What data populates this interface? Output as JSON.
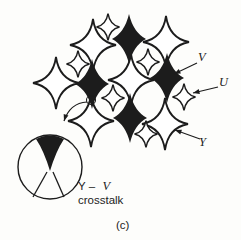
{
  "figure": {
    "caption": "(c)",
    "ink_color": "#1c1c1c",
    "paper_color": "#fdfdfb",
    "labels": {
      "v": "V",
      "u": "U",
      "y": "Y"
    },
    "crosstalk": {
      "prefix": "Y –",
      "v": "V",
      "line2": "crosstalk"
    }
  },
  "diagram": {
    "star_sizes": {
      "y": {
        "a": 23,
        "b": 26,
        "k": 0.14
      },
      "v": {
        "a": 17,
        "b": 25,
        "k": 0.26
      },
      "u": {
        "a": 11.5,
        "b": 13.5,
        "k": 0.16
      }
    },
    "y_stars": [
      [
        93,
        45
      ],
      [
        166,
        42
      ],
      [
        56,
        83
      ],
      [
        131,
        80
      ],
      [
        91,
        121
      ],
      [
        165,
        124
      ]
    ],
    "v_stars": [
      [
        129,
        39
      ],
      [
        167,
        78
      ],
      [
        92,
        84
      ],
      [
        130,
        118
      ]
    ],
    "u_stars": [
      [
        108,
        27
      ],
      [
        78,
        64
      ],
      [
        148,
        62
      ],
      [
        113,
        98
      ],
      [
        184,
        97
      ],
      [
        146,
        134
      ]
    ],
    "pointer_arrows": [
      {
        "name": "v-pointer-arrow",
        "from": [
          197,
          63
        ],
        "to": [
          174,
          74
        ]
      },
      {
        "name": "u-pointer-arrow",
        "from": [
          218,
          87
        ],
        "to": [
          193,
          93
        ]
      },
      {
        "name": "y-pointer-arrow",
        "from": [
          200,
          139
        ],
        "to": [
          175,
          130
        ]
      }
    ],
    "magnify_arrow": {
      "start": [
        87,
        102
      ],
      "ctrl": [
        70,
        103
      ],
      "end": [
        64,
        121
      ]
    },
    "marker_circle": {
      "cx": 91,
      "cy": 100,
      "r": 4.5
    },
    "inset_circle": {
      "cx": 50,
      "cy": 167,
      "r": 32
    }
  }
}
